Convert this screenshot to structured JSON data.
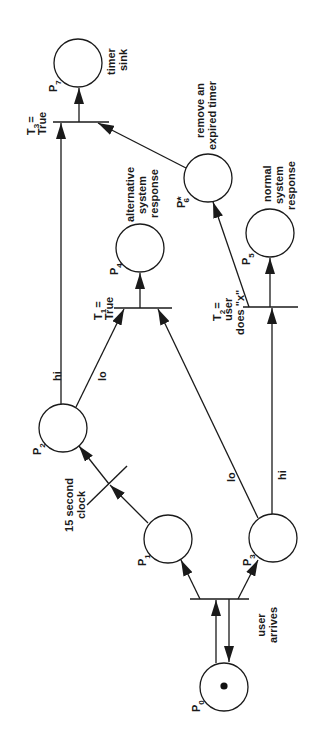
{
  "diagram": {
    "type": "petri-net",
    "orientation": "rotated -90deg (text reads bottom-to-top)",
    "places": [
      {
        "id": "P0",
        "label": "P",
        "sub": "0",
        "description": "",
        "token": true
      },
      {
        "id": "P1",
        "label": "P",
        "sub": "1",
        "description": ""
      },
      {
        "id": "P2",
        "label": "P",
        "sub": "2",
        "description": ""
      },
      {
        "id": "P3",
        "label": "P",
        "sub": "3",
        "description": ""
      },
      {
        "id": "P4",
        "label": "P",
        "sub": "4",
        "description_lines": [
          "alternative",
          "system",
          "response"
        ]
      },
      {
        "id": "P5",
        "label": "P",
        "sub": "5",
        "description_lines": [
          "normal",
          "system",
          "response"
        ]
      },
      {
        "id": "P6",
        "label": "P*",
        "sub": "6",
        "description_lines": [
          "remove an",
          "expired timer"
        ]
      },
      {
        "id": "P7",
        "label": "P",
        "sub": "7",
        "description_lines": [
          "timer",
          "sink"
        ]
      }
    ],
    "transitions": [
      {
        "id": "T0",
        "label_lines": [
          "user",
          "arrives"
        ]
      },
      {
        "id": "clock",
        "label_lines": [
          "15 second",
          "clock"
        ]
      },
      {
        "id": "T1",
        "label": "T",
        "sub": "1",
        "label_lines": [
          "=",
          "True"
        ]
      },
      {
        "id": "T2",
        "label": "T",
        "sub": "2",
        "label_lines": [
          "=",
          "user",
          "does \"x\""
        ]
      },
      {
        "id": "T3",
        "label": "T",
        "sub": "3",
        "label_lines": [
          "=",
          "True"
        ]
      }
    ],
    "arc_labels": {
      "p2_to_t3": "hi",
      "p2_to_t1": "lo",
      "p3_to_t1": "lo",
      "p3_to_t2": "hi"
    },
    "colors": {
      "ink": "#1a1a1a",
      "background": "#ffffff"
    }
  }
}
